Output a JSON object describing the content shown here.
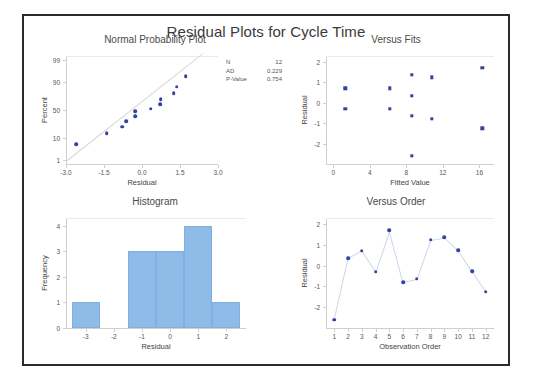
{
  "main": {
    "title": "Residual Plots for Cycle Time"
  },
  "stats": {
    "rows": [
      {
        "key": "N",
        "value": "12"
      },
      {
        "key": "AD",
        "value": "0.229"
      },
      {
        "key": "P-Value",
        "value": "0.754"
      }
    ]
  },
  "colors": {
    "marker": "#33429e",
    "bar": "#8fbbe8",
    "line": "#cdd7e8",
    "refline": "#d8d8d8",
    "frame": "#2b2b2b",
    "axis": "#cfcfcf"
  },
  "chart_data": [
    {
      "type": "scatter",
      "title": "Normal Probability Plot",
      "xlabel": "Residual",
      "ylabel": "Percent",
      "xlim": [
        -3.0,
        3.0
      ],
      "xticks": [
        "-3.0",
        "-1.5",
        "0.0",
        "1.5",
        "3.0"
      ],
      "xtickvals": [
        -3.0,
        -1.5,
        0.0,
        1.5,
        3.0
      ],
      "yticks": [
        "1",
        "10",
        "50",
        "90",
        "99"
      ],
      "ytickvals": [
        1,
        10,
        50,
        90,
        99
      ],
      "yscale": "normal-probability",
      "grid": false,
      "reference_line": true,
      "x": [
        -2.6,
        -1.39,
        -0.78,
        -0.63,
        -0.28,
        -0.27,
        0.35,
        0.72,
        0.74,
        1.25,
        1.37,
        1.72
      ],
      "percent": [
        5.7,
        13.8,
        22.1,
        30.5,
        38.9,
        47.3,
        52.7,
        61.1,
        69.5,
        77.9,
        86.2,
        94.3
      ]
    },
    {
      "type": "scatter",
      "title": "Versus Fits",
      "xlabel": "Fitted Value",
      "ylabel": "Residual",
      "xlim": [
        -0.8,
        17.6
      ],
      "ylim": [
        -3.0,
        2.3
      ],
      "xticks": [
        "0",
        "4",
        "8",
        "12",
        "16"
      ],
      "xtickvals": [
        0,
        4,
        8,
        12,
        16
      ],
      "yticks": [
        "-2",
        "-1",
        "0",
        "1",
        "2"
      ],
      "ytickvals": [
        -2,
        -1,
        0,
        1,
        2
      ],
      "grid": false,
      "x": [
        1.3,
        1.3,
        6.2,
        6.2,
        8.6,
        8.6,
        8.6,
        8.6,
        10.8,
        10.8,
        16.3,
        16.3
      ],
      "y": [
        0.72,
        -0.28,
        0.72,
        -0.28,
        1.37,
        0.35,
        -0.63,
        -2.6,
        1.25,
        -0.78,
        1.72,
        -1.25
      ]
    },
    {
      "type": "bar",
      "title": "Histogram",
      "xlabel": "Residual",
      "ylabel": "Frequency",
      "xlim": [
        -3.7,
        2.7
      ],
      "ylim": [
        0,
        4.3
      ],
      "xticks": [
        "-3",
        "-2",
        "-1",
        "0",
        "1",
        "2"
      ],
      "xtickvals": [
        -3,
        -2,
        -1,
        0,
        1,
        2
      ],
      "yticks": [
        "0",
        "1",
        "2",
        "3",
        "4"
      ],
      "ytickvals": [
        0,
        1,
        2,
        3,
        4
      ],
      "grid": false,
      "bins": [
        {
          "left": -3.5,
          "right": -2.5,
          "count": 1
        },
        {
          "left": -1.5,
          "right": -0.5,
          "count": 3
        },
        {
          "left": -0.5,
          "right": 0.5,
          "count": 3
        },
        {
          "left": 0.5,
          "right": 1.5,
          "count": 4
        },
        {
          "left": 1.5,
          "right": 2.5,
          "count": 1
        }
      ]
    },
    {
      "type": "line",
      "title": "Versus Order",
      "xlabel": "Observation Order",
      "ylabel": "Residual",
      "xlim": [
        0.4,
        12.6
      ],
      "ylim": [
        -3.0,
        2.3
      ],
      "xticks": [
        "1",
        "2",
        "3",
        "4",
        "5",
        "6",
        "7",
        "8",
        "9",
        "10",
        "11",
        "12"
      ],
      "xtickvals": [
        1,
        2,
        3,
        4,
        5,
        6,
        7,
        8,
        9,
        10,
        11,
        12
      ],
      "yticks": [
        "-2",
        "-1",
        "0",
        "1",
        "2"
      ],
      "ytickvals": [
        -2,
        -1,
        0,
        1,
        2
      ],
      "grid": false,
      "x": [
        1,
        2,
        3,
        4,
        5,
        6,
        7,
        8,
        9,
        10,
        11,
        12
      ],
      "y": [
        -2.6,
        0.35,
        0.72,
        -0.28,
        1.72,
        -0.78,
        -0.63,
        1.25,
        1.37,
        0.74,
        -0.27,
        -1.25
      ]
    }
  ]
}
